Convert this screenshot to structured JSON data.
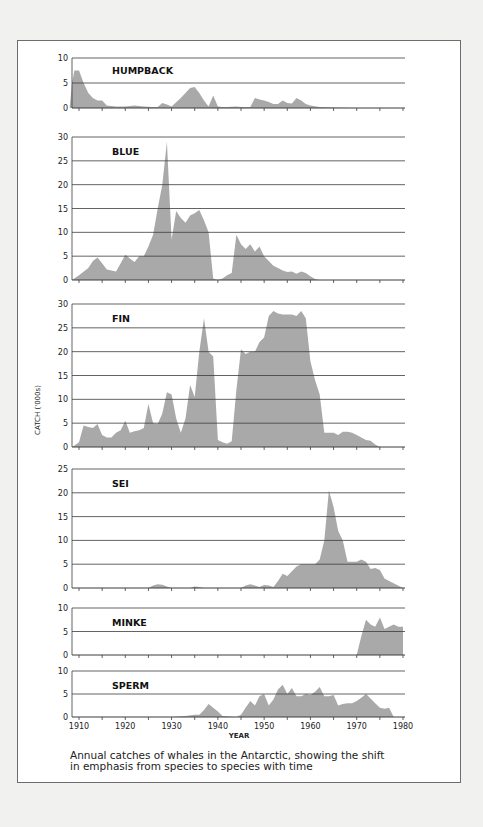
{
  "caption": {
    "line1": "Annual catches of whales in the Antarctic, showing the shift",
    "line2": "in emphasis from species to species with time"
  },
  "colors": {
    "fill": "#a9a9a9",
    "grid": "#3c3c3c",
    "text": "#222222",
    "frame": "#6d6d6d"
  },
  "chart_data": {
    "type": "area",
    "title": "Annual catches of whales in the Antarctic, showing the shift in emphasis from species to species with time",
    "xlabel": "YEAR",
    "ylabel": "CATCH ('000s)",
    "x_ticks": [
      1910,
      1920,
      1930,
      1940,
      1950,
      1960,
      1970,
      1980
    ],
    "xlim": [
      1908,
      1980
    ],
    "grid": true,
    "legend": "none (panel labels)",
    "panels": [
      {
        "name": "HUMPBACK",
        "ylim": [
          0,
          10
        ],
        "y_ticks": [
          0,
          5,
          10
        ],
        "x": [
          1908,
          1909,
          1910,
          1911,
          1912,
          1913,
          1914,
          1915,
          1916,
          1918,
          1920,
          1922,
          1924,
          1926,
          1927,
          1928,
          1929,
          1930,
          1932,
          1934,
          1935,
          1936,
          1937,
          1938,
          1939,
          1940,
          1941,
          1942,
          1944,
          1945,
          1946,
          1947,
          1948,
          1949,
          1950,
          1951,
          1952,
          1953,
          1954,
          1955,
          1956,
          1957,
          1958,
          1959,
          1960,
          1962,
          1965,
          1970,
          1980
        ],
        "values": [
          5,
          7.5,
          7.5,
          5,
          3,
          2,
          1.5,
          1.5,
          0.5,
          0.3,
          0.3,
          0.5,
          0.3,
          0.2,
          0.2,
          1,
          0.7,
          0.3,
          2,
          4,
          4.2,
          3,
          1.5,
          0.3,
          2.5,
          0.3,
          0.2,
          0.2,
          0.3,
          0.2,
          0.2,
          0.2,
          2,
          1.7,
          1.5,
          1.2,
          0.8,
          0.8,
          1.5,
          1,
          0.9,
          2,
          1.5,
          0.8,
          0.5,
          0.2,
          0.1,
          0,
          0
        ]
      },
      {
        "name": "BLUE",
        "ylim": [
          0,
          30
        ],
        "y_ticks": [
          0,
          5,
          10,
          15,
          20,
          25,
          30
        ],
        "x": [
          1908,
          1910,
          1912,
          1913,
          1914,
          1915,
          1916,
          1917,
          1918,
          1919,
          1920,
          1921,
          1922,
          1923,
          1924,
          1925,
          1926,
          1927,
          1928,
          1929,
          1930,
          1931,
          1932,
          1933,
          1934,
          1935,
          1936,
          1937,
          1938,
          1939,
          1940,
          1941,
          1942,
          1943,
          1944,
          1945,
          1946,
          1947,
          1948,
          1949,
          1950,
          1951,
          1952,
          1953,
          1954,
          1955,
          1956,
          1957,
          1958,
          1959,
          1960,
          1961,
          1962,
          1970,
          1980
        ],
        "values": [
          0,
          1,
          2.5,
          4,
          4.7,
          3.5,
          2.2,
          2,
          1.8,
          3.5,
          5.3,
          4.5,
          3.8,
          5,
          5,
          7,
          9.5,
          15,
          20,
          29,
          8.5,
          14.5,
          13,
          12,
          13.5,
          14,
          14.7,
          12.5,
          10,
          0.3,
          0,
          0.3,
          1,
          1.5,
          9.5,
          7.5,
          6.5,
          7.5,
          6,
          7,
          5,
          4,
          3,
          2.5,
          2,
          1.7,
          1.8,
          1.3,
          1.8,
          1.5,
          0.8,
          0.2,
          0,
          0,
          0
        ]
      },
      {
        "name": "FIN",
        "ylim": [
          0,
          30
        ],
        "y_ticks": [
          0,
          5,
          10,
          15,
          20,
          25,
          30
        ],
        "x": [
          1908,
          1909,
          1910,
          1911,
          1912,
          1913,
          1914,
          1915,
          1916,
          1917,
          1918,
          1919,
          1920,
          1921,
          1922,
          1923,
          1924,
          1925,
          1926,
          1927,
          1928,
          1929,
          1930,
          1931,
          1932,
          1933,
          1934,
          1935,
          1936,
          1937,
          1938,
          1939,
          1940,
          1941,
          1942,
          1943,
          1944,
          1945,
          1946,
          1947,
          1948,
          1949,
          1950,
          1951,
          1952,
          1953,
          1954,
          1955,
          1956,
          1957,
          1958,
          1959,
          1960,
          1961,
          1962,
          1963,
          1964,
          1965,
          1966,
          1967,
          1968,
          1969,
          1970,
          1971,
          1972,
          1973,
          1974,
          1975,
          1980
        ],
        "values": [
          0,
          0.3,
          1,
          4.5,
          4.2,
          4,
          4.8,
          2.5,
          2,
          2,
          3,
          3.5,
          5.5,
          3,
          3.3,
          3.5,
          4,
          9,
          5,
          4.8,
          7,
          11.5,
          11,
          6,
          3,
          6,
          13,
          10.5,
          20,
          27,
          20,
          19,
          1.5,
          1,
          0.7,
          1.2,
          12,
          20.5,
          19.5,
          20,
          20,
          22,
          23,
          27.5,
          28.5,
          28,
          27.8,
          27.8,
          27.8,
          27.5,
          28.5,
          27,
          18,
          14,
          11,
          3,
          3,
          3,
          2.5,
          3.2,
          3.2,
          3,
          2.5,
          2,
          1.5,
          1.3,
          0.5,
          0,
          0
        ]
      },
      {
        "name": "SEI",
        "ylim": [
          0,
          25
        ],
        "y_ticks": [
          0,
          5,
          10,
          15,
          20,
          25
        ],
        "x": [
          1908,
          1920,
          1925,
          1926,
          1927,
          1928,
          1929,
          1930,
          1934,
          1935,
          1936,
          1937,
          1945,
          1946,
          1947,
          1948,
          1949,
          1950,
          1951,
          1952,
          1953,
          1954,
          1955,
          1956,
          1957,
          1958,
          1959,
          1960,
          1961,
          1962,
          1963,
          1964,
          1965,
          1966,
          1967,
          1968,
          1969,
          1970,
          1971,
          1972,
          1973,
          1974,
          1975,
          1976,
          1977,
          1980
        ],
        "values": [
          0,
          0,
          0,
          0.5,
          0.8,
          0.7,
          0.3,
          0,
          0,
          0.3,
          0.2,
          0,
          0,
          0.5,
          0.8,
          0.5,
          0.2,
          0.6,
          0.5,
          0.2,
          1.5,
          3,
          2.5,
          3.5,
          4.5,
          5,
          5,
          5,
          5,
          6,
          10,
          20.5,
          17,
          12,
          10,
          5.5,
          5.5,
          5.5,
          6,
          5.5,
          4,
          4.2,
          3.8,
          2,
          1.5,
          0
        ]
      },
      {
        "name": "MINKE",
        "ylim": [
          0,
          10
        ],
        "y_ticks": [
          0,
          5,
          10
        ],
        "x": [
          1908,
          1970,
          1971,
          1972,
          1973,
          1974,
          1975,
          1976,
          1977,
          1978,
          1979,
          1980
        ],
        "values": [
          0,
          0,
          4,
          7.5,
          6.5,
          6,
          8,
          5.5,
          6,
          6.5,
          6,
          6
        ]
      },
      {
        "name": "SPERM",
        "ylim": [
          0,
          10
        ],
        "y_ticks": [
          0,
          5,
          10
        ],
        "x": [
          1908,
          1930,
          1933,
          1935,
          1936,
          1937,
          1938,
          1939,
          1940,
          1941,
          1944,
          1945,
          1946,
          1947,
          1948,
          1949,
          1950,
          1951,
          1952,
          1953,
          1954,
          1955,
          1956,
          1957,
          1958,
          1959,
          1960,
          1961,
          1962,
          1963,
          1964,
          1965,
          1966,
          1967,
          1968,
          1969,
          1970,
          1971,
          1972,
          1973,
          1974,
          1975,
          1976,
          1977,
          1978,
          1980
        ],
        "values": [
          0,
          0,
          0.2,
          0.5,
          0.5,
          1.5,
          2.8,
          2,
          1.2,
          0.2,
          0,
          0.5,
          2,
          3.5,
          2.5,
          4.5,
          5,
          2.5,
          3.8,
          6,
          7,
          5,
          6.3,
          4.5,
          4.5,
          5,
          4.8,
          5.5,
          6.5,
          4.5,
          4.5,
          4.8,
          2.5,
          2.8,
          3,
          3,
          3.5,
          4.2,
          5,
          4,
          3,
          2,
          1.8,
          2,
          0,
          0
        ]
      }
    ]
  }
}
